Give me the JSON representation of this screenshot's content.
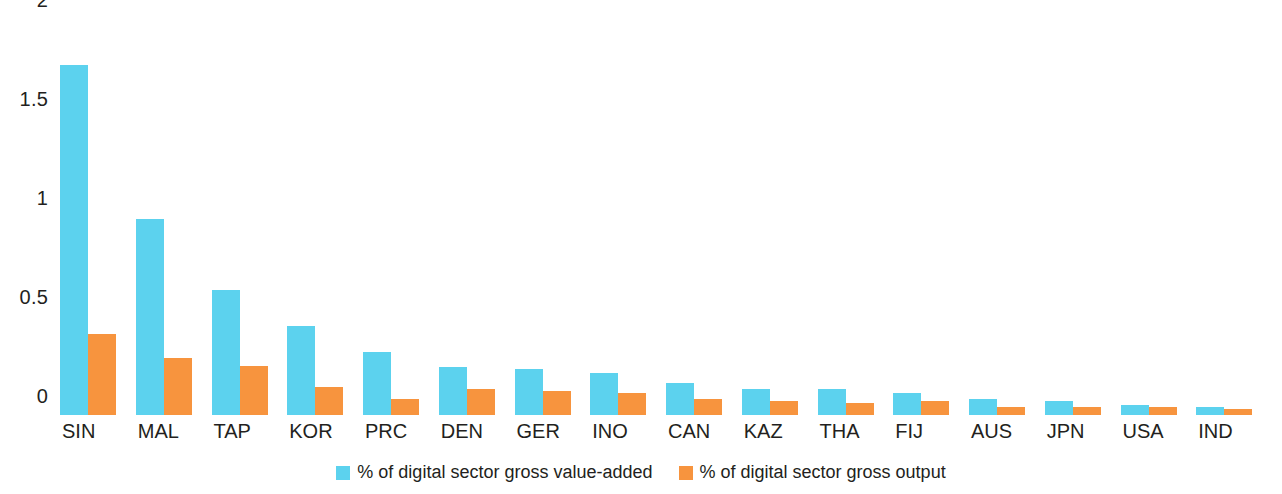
{
  "chart_data": {
    "type": "bar",
    "title": "",
    "subtitle": "",
    "xlabel": "",
    "ylabel": "",
    "ylim": [
      0,
      2
    ],
    "grid": false,
    "legend_position": "bottom-center",
    "y_ticks": [
      "0",
      "0.5",
      "1",
      "1.5",
      "2"
    ],
    "y_tick_values": [
      0,
      0.5,
      1,
      1.5,
      2
    ],
    "categories": [
      "SIN",
      "MAL",
      "TAP",
      "KOR",
      "PRC",
      "DEN",
      "GER",
      "INO",
      "CAN",
      "KAZ",
      "THA",
      "FIJ",
      "AUS",
      "JPN",
      "USA",
      "IND"
    ],
    "series": [
      {
        "name": "% of digital sector gross value-added",
        "color": "#5cd2ee",
        "values": [
          1.77,
          0.99,
          0.63,
          0.45,
          0.32,
          0.24,
          0.23,
          0.21,
          0.16,
          0.13,
          0.13,
          0.11,
          0.08,
          0.07,
          0.05,
          0.04
        ]
      },
      {
        "name": "% of digital sector gross output",
        "color": "#f7943e",
        "values": [
          0.41,
          0.29,
          0.25,
          0.14,
          0.08,
          0.13,
          0.12,
          0.11,
          0.08,
          0.07,
          0.06,
          0.07,
          0.04,
          0.04,
          0.04,
          0.03
        ]
      }
    ]
  },
  "colors": {
    "series_blue": "#5cd2ee",
    "series_orange": "#f7943e",
    "text": "#231f20",
    "background": "#ffffff"
  }
}
